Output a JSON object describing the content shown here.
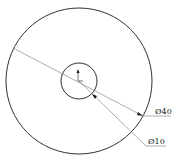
{
  "drawing": {
    "type": "concentric-circles",
    "outer_circle": {
      "label": "Ø40",
      "cx": 79,
      "cy": 81,
      "r": 73
    },
    "inner_circle": {
      "label": "Ø10",
      "cx": 79,
      "cy": 81,
      "r": 18
    },
    "dimensions": [
      {
        "id": "outer",
        "text": "Ø40"
      },
      {
        "id": "inner",
        "text": "Ø10"
      }
    ],
    "colors": {
      "stroke": "#1a1a1a",
      "leader": "#8a8a8a",
      "background": "#ffffff"
    }
  }
}
